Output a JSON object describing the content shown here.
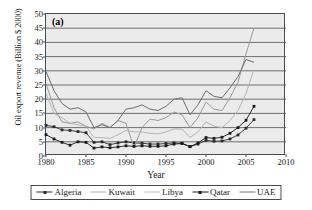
{
  "figure": {
    "panel_label": "(a)",
    "background": "#ebebeb",
    "frame_color": "#4a4a4a"
  },
  "chart_data": {
    "type": "line",
    "title": "(a)",
    "xlabel": "Year",
    "ylabel": "Oil export revenue (Billion $ 2000)",
    "xlim": [
      1980,
      2010
    ],
    "ylim": [
      0,
      50
    ],
    "xticks": [
      1980,
      1985,
      1990,
      1995,
      2000,
      2005,
      2010
    ],
    "yticks": [
      0,
      5,
      10,
      15,
      20,
      25,
      30,
      35,
      40,
      45,
      50
    ],
    "grid": "horizontal",
    "legend_position": "bottom",
    "x": [
      1980,
      1981,
      1982,
      1983,
      1984,
      1985,
      1986,
      1987,
      1988,
      1989,
      1990,
      1991,
      1992,
      1993,
      1994,
      1995,
      1996,
      1997,
      1998,
      1999,
      2000,
      2001,
      2002,
      2003,
      2004,
      2005,
      2006
    ],
    "series": [
      {
        "name": "Algeria",
        "color": "#2b2b2b",
        "marker": "square",
        "values": [
          10.8,
          10.3,
          9.2,
          9.0,
          8.6,
          8.2,
          4.8,
          5.0,
          4.0,
          4.6,
          5.0,
          4.6,
          4.5,
          4.2,
          4.2,
          4.4,
          4.6,
          4.5,
          3.3,
          4.2,
          5.5,
          5.2,
          5.3,
          6.0,
          7.4,
          9.8,
          12.8
        ]
      },
      {
        "name": "Kuwait",
        "color": "#9a9a9a",
        "marker": "none",
        "values": [
          25.5,
          17.0,
          12.0,
          11.5,
          12.0,
          10.5,
          9.5,
          11.5,
          10.0,
          12.5,
          11.5,
          3.0,
          10.0,
          13.0,
          12.5,
          13.5,
          15.5,
          14.5,
          10.0,
          13.5,
          19.0,
          16.5,
          16.0,
          20.5,
          26.0,
          36.0,
          45.0
        ]
      },
      {
        "name": "Libya",
        "color": "#b5b5b5",
        "marker": "none",
        "values": [
          22.0,
          15.0,
          13.5,
          11.5,
          11.0,
          10.5,
          6.5,
          6.5,
          6.2,
          7.5,
          9.0,
          8.5,
          8.5,
          8.0,
          7.8,
          8.5,
          9.5,
          9.5,
          6.5,
          8.5,
          12.0,
          10.5,
          10.0,
          12.5,
          16.0,
          22.0,
          30.5
        ]
      },
      {
        "name": "Qatar",
        "color": "#1a1a1a",
        "marker": "square",
        "values": [
          7.5,
          6.0,
          4.8,
          3.8,
          5.0,
          4.8,
          2.8,
          3.2,
          2.9,
          3.2,
          3.6,
          3.4,
          3.6,
          3.4,
          3.4,
          3.6,
          4.2,
          4.4,
          3.3,
          4.6,
          6.5,
          6.2,
          6.6,
          8.0,
          10.0,
          12.6,
          17.5
        ]
      },
      {
        "name": "UAE",
        "color": "#6e6e6e",
        "marker": "none",
        "values": [
          29.8,
          23.0,
          18.5,
          16.5,
          17.0,
          15.5,
          10.0,
          11.0,
          10.0,
          12.5,
          16.5,
          17.0,
          18.0,
          16.5,
          16.0,
          17.5,
          20.0,
          20.5,
          14.5,
          18.0,
          23.0,
          21.0,
          20.5,
          24.0,
          28.0,
          34.0,
          33.0
        ]
      }
    ]
  },
  "legend": {
    "items": [
      {
        "label": "Algeria",
        "color": "#2b2b2b",
        "marker": "square"
      },
      {
        "label": "Kuwait",
        "color": "#b0b0b0",
        "marker": "none"
      },
      {
        "label": "Libya",
        "color": "#bdbdbd",
        "marker": "none"
      },
      {
        "label": "Qatar",
        "color": "#1a1a1a",
        "marker": "square"
      },
      {
        "label": "UAE",
        "color": "#7a7a7a",
        "marker": "none"
      }
    ]
  }
}
